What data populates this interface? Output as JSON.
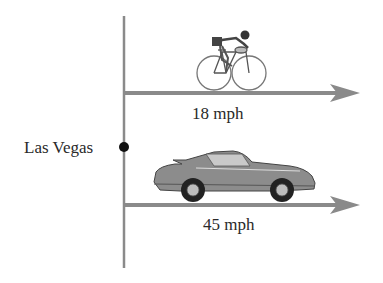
{
  "diagram": {
    "origin_label": "Las Vegas",
    "travelers": [
      {
        "name": "bicyclist",
        "icon": "bicycle-rider-icon",
        "speed_label": "18 mph",
        "direction": "right"
      },
      {
        "name": "car",
        "icon": "sports-car-icon",
        "speed_label": "45 mph",
        "direction": "right"
      }
    ]
  },
  "colors": {
    "line": "#8a8a8a",
    "dot": "#111111",
    "vehicle_body": "#8c8c8c",
    "text": "#2a2a2a"
  }
}
